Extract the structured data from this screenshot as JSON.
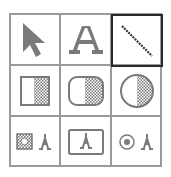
{
  "palette": {
    "title": "Tool palette",
    "selected_tool": "line",
    "colors": {
      "grid": "#9a9a9a",
      "selected_border": "#2a2a2a",
      "icon": "#7a7a7a",
      "background": "#ffffff"
    },
    "tools": [
      {
        "id": "pointer",
        "icon": "arrow-pointer-icon",
        "row": 1,
        "col": 1
      },
      {
        "id": "text",
        "icon": "text-A-icon",
        "row": 1,
        "col": 2
      },
      {
        "id": "line",
        "icon": "diagonal-line-icon",
        "row": 1,
        "col": 3,
        "selected": true
      },
      {
        "id": "rectangle",
        "icon": "half-filled-rectangle-icon",
        "row": 2,
        "col": 1
      },
      {
        "id": "rounded-rectangle",
        "icon": "half-filled-rounded-rectangle-icon",
        "row": 2,
        "col": 2
      },
      {
        "id": "oval",
        "icon": "half-filled-oval-icon",
        "row": 2,
        "col": 3
      },
      {
        "id": "button-text",
        "icon": "checkbox-with-A-icon",
        "row": 3,
        "col": 1
      },
      {
        "id": "framed-text",
        "icon": "framed-A-icon",
        "row": 3,
        "col": 2
      },
      {
        "id": "radio-text",
        "icon": "radio-with-A-icon",
        "row": 3,
        "col": 3
      }
    ]
  }
}
